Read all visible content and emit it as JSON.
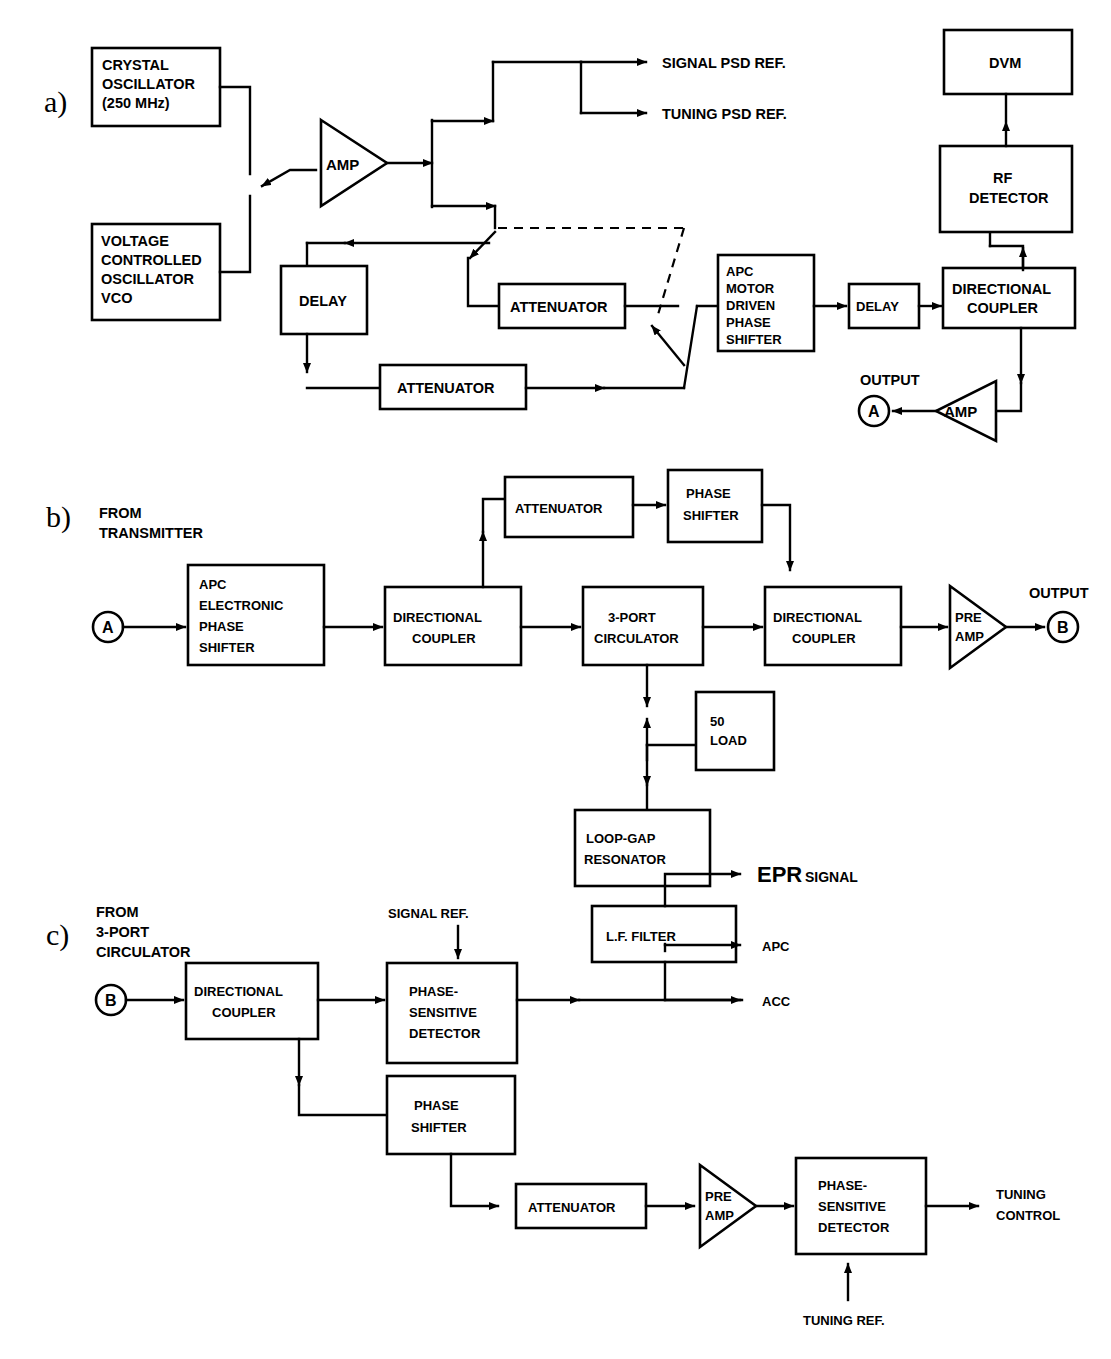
{
  "figure": {
    "type": "block-diagram",
    "panels": [
      {
        "id": "a",
        "letter": "a)",
        "title": "Transmitter / reference arm",
        "blocks": [
          {
            "name": "crystal-oscillator",
            "lines": [
              "CRYSTAL",
              "OSCILLATOR",
              "(250 MHz)"
            ]
          },
          {
            "name": "vco",
            "lines": [
              "VOLTAGE",
              "CONTROLLED",
              "OSCILLATOR",
              "VCO"
            ]
          },
          {
            "name": "amp",
            "lines": [
              "AMP"
            ],
            "shape": "triangle"
          },
          {
            "name": "delay-1",
            "lines": [
              "DELAY"
            ]
          },
          {
            "name": "attenuator-1",
            "lines": [
              "ATTENUATOR"
            ]
          },
          {
            "name": "attenuator-2",
            "lines": [
              "ATTENUATOR"
            ]
          },
          {
            "name": "apc-motor-driven-phase-shifter",
            "lines": [
              "APC",
              "MOTOR",
              "DRIVEN",
              "PHASE",
              "SHIFTER"
            ]
          },
          {
            "name": "delay-2",
            "lines": [
              "DELAY"
            ]
          },
          {
            "name": "directional-coupler",
            "lines": [
              "DIRECTIONAL",
              "COUPLER"
            ]
          },
          {
            "name": "rf-detector",
            "lines": [
              "RF",
              "DETECTOR"
            ]
          },
          {
            "name": "dvm",
            "lines": [
              "DVM"
            ]
          },
          {
            "name": "output-amp",
            "lines": [
              "AMP"
            ],
            "shape": "triangle"
          },
          {
            "name": "node-a",
            "lines": [
              "A"
            ],
            "shape": "circle"
          }
        ],
        "labels": [
          {
            "name": "signal-psd-ref",
            "text": "SIGNAL PSD REF."
          },
          {
            "name": "tuning-psd-ref",
            "text": "TUNING PSD REF."
          },
          {
            "name": "output",
            "text": "OUTPUT"
          }
        ]
      },
      {
        "id": "b",
        "letter": "b)",
        "title": "Resonator bridge",
        "blocks": [
          {
            "name": "node-a",
            "lines": [
              "A"
            ],
            "shape": "circle"
          },
          {
            "name": "apc-electronic-phase-shifter",
            "lines": [
              "APC",
              "ELECTRONIC",
              "PHASE",
              "SHIFTER"
            ]
          },
          {
            "name": "directional-coupler-1",
            "lines": [
              "DIRECTIONAL",
              "COUPLER"
            ]
          },
          {
            "name": "attenuator",
            "lines": [
              "ATTENUATOR"
            ]
          },
          {
            "name": "phase-shifter",
            "lines": [
              "PHASE",
              "SHIFTER"
            ]
          },
          {
            "name": "three-port-circulator",
            "lines": [
              "3-PORT",
              "CIRCULATOR"
            ]
          },
          {
            "name": "directional-coupler-2",
            "lines": [
              "DIRECTIONAL",
              "COUPLER"
            ]
          },
          {
            "name": "pre-amp",
            "lines": [
              "PRE",
              "AMP"
            ],
            "shape": "triangle"
          },
          {
            "name": "fifty-ohm-load",
            "lines": [
              "50",
              "LOAD"
            ]
          },
          {
            "name": "loop-gap-resonator",
            "lines": [
              "LOOP-GAP",
              "RESONATOR"
            ]
          },
          {
            "name": "node-b",
            "lines": [
              "B"
            ],
            "shape": "circle"
          }
        ],
        "labels": [
          {
            "name": "from-transmitter",
            "lines": [
              "FROM",
              "TRANSMITTER"
            ]
          },
          {
            "name": "output",
            "text": "OUTPUT"
          }
        ]
      },
      {
        "id": "c",
        "letter": "c)",
        "title": "Detection / control arm",
        "blocks": [
          {
            "name": "node-b",
            "lines": [
              "B"
            ],
            "shape": "circle"
          },
          {
            "name": "directional-coupler",
            "lines": [
              "DIRECTIONAL",
              "COUPLER"
            ]
          },
          {
            "name": "phase-sensitive-detector-1",
            "lines": [
              "PHASE-",
              "SENSITIVE",
              "DETECTOR"
            ]
          },
          {
            "name": "lf-filter",
            "lines": [
              "L.F. FILTER"
            ]
          },
          {
            "name": "phase-shifter",
            "lines": [
              "PHASE",
              "SHIFTER"
            ]
          },
          {
            "name": "attenuator",
            "lines": [
              "ATTENUATOR"
            ]
          },
          {
            "name": "pre-amp",
            "lines": [
              "PRE",
              "AMP"
            ],
            "shape": "triangle"
          },
          {
            "name": "phase-sensitive-detector-2",
            "lines": [
              "PHASE-",
              "SENSITIVE",
              "DETECTOR"
            ]
          }
        ],
        "labels": [
          {
            "name": "from-3-port-circulator",
            "lines": [
              "FROM",
              "3-PORT",
              "CIRCULATOR"
            ]
          },
          {
            "name": "signal-ref",
            "text": "SIGNAL REF."
          },
          {
            "name": "epr-signal-main",
            "text": "EPR"
          },
          {
            "name": "epr-signal-sub",
            "text": "SIGNAL"
          },
          {
            "name": "apc-output",
            "text": "APC"
          },
          {
            "name": "acc-output",
            "text": "ACC"
          },
          {
            "name": "tuning-ref",
            "text": "TUNING REF."
          },
          {
            "name": "tuning-control",
            "lines": [
              "TUNING",
              "CONTROL"
            ]
          }
        ]
      }
    ]
  },
  "panel_a": {
    "letter": "a)",
    "crystal_oscillator_l1": "CRYSTAL",
    "crystal_oscillator_l2": "OSCILLATOR",
    "crystal_oscillator_l3": "(250 MHz)",
    "vco_l1": "VOLTAGE",
    "vco_l2": "CONTROLLED",
    "vco_l3": "OSCILLATOR",
    "vco_l4": "VCO",
    "amp": "AMP",
    "signal_psd_ref": "SIGNAL PSD REF.",
    "tuning_psd_ref": "TUNING PSD REF.",
    "delay_1": "DELAY",
    "attenuator_1": "ATTENUATOR",
    "attenuator_2": "ATTENUATOR",
    "apc_l1": "APC",
    "apc_l2": "MOTOR",
    "apc_l3": "DRIVEN",
    "apc_l4": "PHASE",
    "apc_l5": "SHIFTER",
    "delay_2": "DELAY",
    "dir_coupler_l1": "DIRECTIONAL",
    "dir_coupler_l2": "COUPLER",
    "rf_detector_l1": "RF",
    "rf_detector_l2": "DETECTOR",
    "dvm": "DVM",
    "output": "OUTPUT",
    "out_amp": "AMP",
    "node_a": "A"
  },
  "panel_b": {
    "letter": "b)",
    "from_l1": "FROM",
    "from_l2": "TRANSMITTER",
    "node_a": "A",
    "apc_l1": "APC",
    "apc_l2": "ELECTRONIC",
    "apc_l3": "PHASE",
    "apc_l4": "SHIFTER",
    "dir_coupler1_l1": "DIRECTIONAL",
    "dir_coupler1_l2": "COUPLER",
    "attenuator": "ATTENUATOR",
    "phase_shifter_l1": "PHASE",
    "phase_shifter_l2": "SHIFTER",
    "circulator_l1": "3-PORT",
    "circulator_l2": "CIRCULATOR",
    "dir_coupler2_l1": "DIRECTIONAL",
    "dir_coupler2_l2": "COUPLER",
    "pre_amp_l1": "PRE",
    "pre_amp_l2": "AMP",
    "output": "OUTPUT",
    "node_b": "B",
    "load_l1": "50",
    "load_l2": "LOAD",
    "resonator_l1": "LOOP-GAP",
    "resonator_l2": "RESONATOR"
  },
  "panel_c": {
    "letter": "c)",
    "from_l1": "FROM",
    "from_l2": "3-PORT",
    "from_l3": "CIRCULATOR",
    "node_b": "B",
    "dir_coupler_l1": "DIRECTIONAL",
    "dir_coupler_l2": "COUPLER",
    "signal_ref": "SIGNAL REF.",
    "psd1_l1": "PHASE-",
    "psd1_l2": "SENSITIVE",
    "psd1_l3": "DETECTOR",
    "lf_filter": "L.F. FILTER",
    "epr_main": "EPR",
    "epr_sub": "SIGNAL",
    "apc": "APC",
    "acc": "ACC",
    "phase_shifter_l1": "PHASE",
    "phase_shifter_l2": "SHIFTER",
    "attenuator": "ATTENUATOR",
    "pre_amp_l1": "PRE",
    "pre_amp_l2": "AMP",
    "psd2_l1": "PHASE-",
    "psd2_l2": "SENSITIVE",
    "psd2_l3": "DETECTOR",
    "tuning_ref": "TUNING REF.",
    "tuning_control_l1": "TUNING",
    "tuning_control_l2": "CONTROL"
  },
  "colors": {
    "ink": "#000000",
    "paper": "#ffffff"
  }
}
